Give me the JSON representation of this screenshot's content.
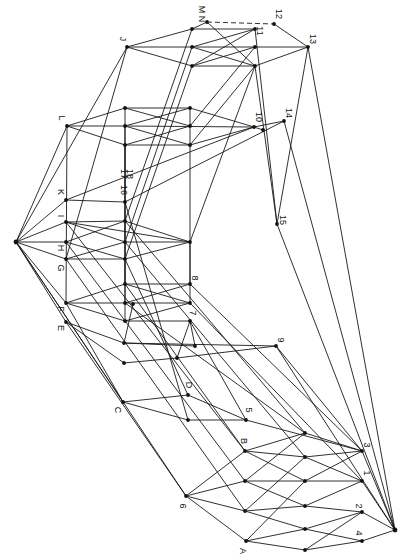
{
  "figure": {
    "type": "lattice-diagram",
    "orientation": "rotated-90",
    "colors": {
      "ink": "#111111",
      "background": "#ffffff"
    }
  },
  "nodes": [
    {
      "id": "top",
      "x": 16,
      "y": 242
    },
    {
      "id": "bottom",
      "x": 395,
      "y": 530
    },
    {
      "id": "J",
      "x": 127,
      "y": 47,
      "label": "J",
      "lx": -5,
      "ly": -8,
      "rot": 90
    },
    {
      "id": "MN",
      "x": 207,
      "y": 22,
      "label": "M N",
      "lx": -6,
      "ly": -8,
      "rot": 90
    },
    {
      "id": "12",
      "x": 274,
      "y": 24,
      "label": "12",
      "lx": 4,
      "ly": -10,
      "rot": 90
    },
    {
      "id": "11",
      "x": 255,
      "y": 29,
      "label": "11",
      "lx": 4,
      "ly": 2,
      "rot": 90
    },
    {
      "id": "13",
      "x": 308,
      "y": 47,
      "label": "13",
      "lx": 4,
      "ly": -8,
      "rot": 90
    },
    {
      "id": "r1a",
      "x": 192,
      "y": 29
    },
    {
      "id": "r1b",
      "x": 192,
      "y": 47
    },
    {
      "id": "r1c",
      "x": 255,
      "y": 47
    },
    {
      "id": "r1d",
      "x": 192,
      "y": 66
    },
    {
      "id": "r1e",
      "x": 255,
      "y": 66
    },
    {
      "id": "L",
      "x": 67,
      "y": 126,
      "label": "L",
      "lx": -6,
      "ly": -8,
      "rot": 90
    },
    {
      "id": "r2a",
      "x": 125,
      "y": 108
    },
    {
      "id": "r2b",
      "x": 190,
      "y": 108
    },
    {
      "id": "r2c",
      "x": 125,
      "y": 126
    },
    {
      "id": "r2d",
      "x": 190,
      "y": 126
    },
    {
      "id": "r2e",
      "x": 125,
      "y": 145
    },
    {
      "id": "r2f",
      "x": 190,
      "y": 145
    },
    {
      "id": "10",
      "x": 254,
      "y": 127,
      "label": "10",
      "lx": 4,
      "ly": -10,
      "rot": 90
    },
    {
      "id": "14",
      "x": 284,
      "y": 121,
      "label": "14",
      "lx": 4,
      "ly": -8,
      "rot": 90
    },
    {
      "id": "m10",
      "x": 263,
      "y": 130
    },
    {
      "id": "K",
      "x": 66,
      "y": 200,
      "label": "K",
      "lx": -6,
      "ly": -8,
      "rot": 90
    },
    {
      "id": "16",
      "x": 125,
      "y": 202,
      "label": "16",
      "lx": -2,
      "ly": -12,
      "rot": 90
    },
    {
      "id": "17",
      "x": 125,
      "y": 202,
      "label": "17",
      "lx": -2,
      "ly": -28,
      "rot": 90
    },
    {
      "id": "18",
      "x": 125,
      "y": 202,
      "label": "18",
      "lx": 4,
      "ly": -28,
      "rot": 90
    },
    {
      "id": "I",
      "x": 66,
      "y": 222,
      "label": "I",
      "lx": -6,
      "ly": -6,
      "rot": 90
    },
    {
      "id": "H",
      "x": 66,
      "y": 242,
      "label": "H",
      "lx": -6,
      "ly": 6,
      "rot": 90
    },
    {
      "id": "G",
      "x": 66,
      "y": 259,
      "label": "G",
      "lx": -6,
      "ly": 9,
      "rot": 90
    },
    {
      "id": "r3a",
      "x": 125,
      "y": 221
    },
    {
      "id": "r3b",
      "x": 125,
      "y": 242
    },
    {
      "id": "r3c",
      "x": 125,
      "y": 259
    },
    {
      "id": "r3d",
      "x": 190,
      "y": 242
    },
    {
      "id": "15",
      "x": 277,
      "y": 224,
      "label": "15",
      "lx": 5,
      "ly": -4,
      "rot": 90
    },
    {
      "id": "F",
      "x": 66,
      "y": 303,
      "label": "F",
      "lx": -6,
      "ly": 6,
      "rot": 90
    },
    {
      "id": "E",
      "x": 66,
      "y": 322,
      "label": "E",
      "lx": -6,
      "ly": 6,
      "rot": 90
    },
    {
      "id": "r4a",
      "x": 125,
      "y": 284
    },
    {
      "id": "r4b",
      "x": 125,
      "y": 303
    },
    {
      "id": "r4c",
      "x": 133,
      "y": 304
    },
    {
      "id": "r4d",
      "x": 125,
      "y": 321
    },
    {
      "id": "r4e",
      "x": 190,
      "y": 321
    },
    {
      "id": "r4f",
      "x": 124,
      "y": 343
    },
    {
      "id": "r4g",
      "x": 195,
      "y": 346
    },
    {
      "id": "r4h",
      "x": 177,
      "y": 358
    },
    {
      "id": "r4i",
      "x": 124,
      "y": 363
    },
    {
      "id": "8",
      "x": 190,
      "y": 284,
      "label": "8",
      "lx": 4,
      "ly": -6,
      "rot": 90
    },
    {
      "id": "7",
      "x": 190,
      "y": 303,
      "label": "7",
      "lx": 2,
      "ly": 10,
      "rot": 90
    },
    {
      "id": "9",
      "x": 276,
      "y": 346,
      "label": "9",
      "lx": 4,
      "ly": -6,
      "rot": 90
    },
    {
      "id": "C",
      "x": 123,
      "y": 402,
      "label": "C",
      "lx": -6,
      "ly": 8,
      "rot": 90
    },
    {
      "id": "D",
      "x": 188,
      "y": 395,
      "label": "D",
      "lx": 0,
      "ly": -10,
      "rot": 90
    },
    {
      "id": "r5a",
      "x": 188,
      "y": 420
    },
    {
      "id": "5",
      "x": 246,
      "y": 420,
      "label": "5",
      "lx": 2,
      "ly": -10,
      "rot": 90
    },
    {
      "id": "B",
      "x": 245,
      "y": 451,
      "label": "B",
      "lx": -2,
      "ly": -10,
      "rot": 90
    },
    {
      "id": "6",
      "x": 186,
      "y": 496,
      "label": "6",
      "lx": -4,
      "ly": 10,
      "rot": 90
    },
    {
      "id": "A",
      "x": 246,
      "y": 541,
      "label": "A",
      "lx": -4,
      "ly": 10,
      "rot": 90
    },
    {
      "id": "c1",
      "x": 305,
      "y": 433
    },
    {
      "id": "3",
      "x": 362,
      "y": 451,
      "label": "3",
      "lx": 4,
      "ly": -6,
      "rot": 90
    },
    {
      "id": "c2",
      "x": 305,
      "y": 457
    },
    {
      "id": "c3",
      "x": 245,
      "y": 481
    },
    {
      "id": "c4",
      "x": 305,
      "y": 481
    },
    {
      "id": "1",
      "x": 362,
      "y": 481,
      "label": "1",
      "lx": 4,
      "ly": -8,
      "rot": 90
    },
    {
      "id": "c5",
      "x": 245,
      "y": 511
    },
    {
      "id": "c6",
      "x": 305,
      "y": 506
    },
    {
      "id": "2",
      "x": 362,
      "y": 512,
      "label": "2",
      "lx": -4,
      "ly": -6,
      "rot": 90
    },
    {
      "id": "c7",
      "x": 305,
      "y": 529
    },
    {
      "id": "4",
      "x": 362,
      "y": 541,
      "label": "4",
      "lx": -4,
      "ly": -8,
      "rot": 90
    },
    {
      "id": "c8",
      "x": 305,
      "y": 550
    }
  ],
  "edges": [
    [
      "top",
      "J"
    ],
    [
      "top",
      "L"
    ],
    [
      "top",
      "K"
    ],
    [
      "top",
      "I"
    ],
    [
      "top",
      "H"
    ],
    [
      "top",
      "G"
    ],
    [
      "top",
      "F"
    ],
    [
      "top",
      "E"
    ],
    [
      "top",
      "C"
    ],
    [
      "top",
      "6"
    ],
    [
      "J",
      "r1a"
    ],
    [
      "J",
      "r1b"
    ],
    [
      "J",
      "r1d"
    ],
    [
      "r1a",
      "MN"
    ],
    [
      "r1a",
      "11"
    ],
    [
      "MN",
      "12"
    ],
    [
      "MN",
      "r1e"
    ],
    [
      "r1b",
      "r1c"
    ],
    [
      "r1b",
      "r1e"
    ],
    [
      "r1d",
      "r1c"
    ],
    [
      "r1d",
      "r1e"
    ],
    [
      "11",
      "r1b"
    ],
    [
      "12",
      "13"
    ],
    [
      "r1c",
      "13"
    ],
    [
      "r1e",
      "13"
    ],
    [
      "11",
      "r1d"
    ],
    [
      "L",
      "r2a"
    ],
    [
      "L",
      "r2c"
    ],
    [
      "L",
      "r2e"
    ],
    [
      "r2a",
      "r2b"
    ],
    [
      "r2a",
      "r2d"
    ],
    [
      "r2c",
      "r2b"
    ],
    [
      "r2c",
      "r2f"
    ],
    [
      "r2e",
      "r2d"
    ],
    [
      "r2e",
      "r2f"
    ],
    [
      "r2c",
      "10"
    ],
    [
      "r2b",
      "10"
    ],
    [
      "r2f",
      "10"
    ],
    [
      "K",
      "16"
    ],
    [
      "K",
      "10"
    ],
    [
      "16",
      "14"
    ],
    [
      "I",
      "r3a"
    ],
    [
      "I",
      "r3b"
    ],
    [
      "H",
      "r3a"
    ],
    [
      "H",
      "r3c"
    ],
    [
      "G",
      "r3b"
    ],
    [
      "G",
      "r3c"
    ],
    [
      "r3a",
      "r3d"
    ],
    [
      "r3b",
      "r3d"
    ],
    [
      "r3c",
      "r3d"
    ],
    [
      "I",
      "r3d"
    ],
    [
      "F",
      "r4a"
    ],
    [
      "F",
      "r4b"
    ],
    [
      "F",
      "r4d"
    ],
    [
      "r4a",
      "8"
    ],
    [
      "r4b",
      "8"
    ],
    [
      "r4b",
      "7"
    ],
    [
      "r4d",
      "7"
    ],
    [
      "r4d",
      "r4e"
    ],
    [
      "r4a",
      "7"
    ],
    [
      "r4c",
      "r4f"
    ],
    [
      "r4e",
      "r4h"
    ],
    [
      "r4e",
      "r4g"
    ],
    [
      "E",
      "r4f"
    ],
    [
      "E",
      "r4i"
    ],
    [
      "r4f",
      "r4g"
    ],
    [
      "r4f",
      "9"
    ],
    [
      "r4i",
      "r4h"
    ],
    [
      "r4h",
      "9"
    ],
    [
      "C",
      "D"
    ],
    [
      "C",
      "r5a"
    ],
    [
      "D",
      "5"
    ],
    [
      "r5a",
      "5"
    ],
    [
      "6",
      "B"
    ],
    [
      "6",
      "c3"
    ],
    [
      "6",
      "c5"
    ],
    [
      "6",
      "A"
    ],
    [
      "B",
      "c1"
    ],
    [
      "B",
      "c2"
    ],
    [
      "B",
      "c4"
    ],
    [
      "c3",
      "c1"
    ],
    [
      "c3",
      "c4"
    ],
    [
      "c3",
      "c6"
    ],
    [
      "c5",
      "c2"
    ],
    [
      "c5",
      "c6"
    ],
    [
      "c5",
      "c7"
    ],
    [
      "A",
      "c4"
    ],
    [
      "A",
      "c7"
    ],
    [
      "A",
      "c8"
    ],
    [
      "c1",
      "3"
    ],
    [
      "c2",
      "3"
    ],
    [
      "c2",
      "1"
    ],
    [
      "c4",
      "1"
    ],
    [
      "c4",
      "3"
    ],
    [
      "c6",
      "2"
    ],
    [
      "c6",
      "1"
    ],
    [
      "c7",
      "2"
    ],
    [
      "c7",
      "4"
    ],
    [
      "c8",
      "4"
    ],
    [
      "c8",
      "2"
    ],
    [
      "3",
      "bottom"
    ],
    [
      "1",
      "bottom"
    ],
    [
      "2",
      "bottom"
    ],
    [
      "4",
      "bottom"
    ],
    [
      "13",
      "bottom"
    ],
    [
      "14",
      "bottom"
    ],
    [
      "9",
      "bottom"
    ],
    [
      "5",
      "3"
    ],
    [
      "15",
      "bottom"
    ],
    [
      "J",
      "G"
    ],
    [
      "L",
      "F"
    ],
    [
      "r1a",
      "r3a"
    ],
    [
      "r1b",
      "r3b"
    ],
    [
      "r1d",
      "r3c"
    ],
    [
      "r2a",
      "r4a"
    ],
    [
      "r2c",
      "r4b"
    ],
    [
      "r2e",
      "r4d"
    ],
    [
      "r1c",
      "r2d"
    ],
    [
      "r1e",
      "r2f"
    ],
    [
      "r2b",
      "r3d"
    ],
    [
      "r3d",
      "7"
    ],
    [
      "8",
      "r3d"
    ],
    [
      "13",
      "15"
    ],
    [
      "11",
      "15"
    ],
    [
      "r1e",
      "15"
    ],
    [
      "r3d",
      "r1e"
    ],
    [
      "I",
      "B"
    ],
    [
      "H",
      "c3"
    ],
    [
      "G",
      "c5"
    ],
    [
      "F",
      "C"
    ],
    [
      "E",
      "6"
    ],
    [
      "r4a",
      "B"
    ],
    [
      "r4b",
      "c1"
    ],
    [
      "r4e",
      "5"
    ],
    [
      "8",
      "3"
    ],
    [
      "7",
      "1"
    ],
    [
      "9",
      "3"
    ],
    [
      "r3a",
      "c1"
    ],
    [
      "r3b",
      "c2"
    ],
    [
      "r3c",
      "D"
    ],
    [
      "16",
      "r5a"
    ],
    [
      "10",
      "14"
    ],
    [
      "10",
      "m10"
    ]
  ],
  "dashed_edges": [
    [
      "MN",
      "12"
    ],
    [
      "r2e",
      "10"
    ],
    [
      "16",
      "m10"
    ]
  ]
}
